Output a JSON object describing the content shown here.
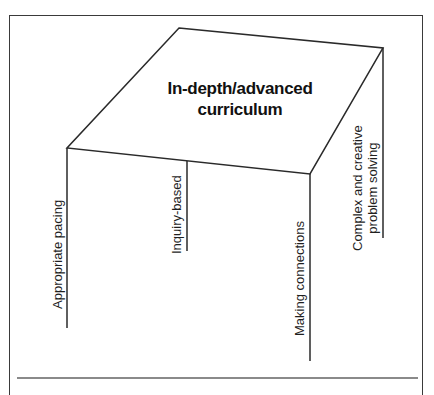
{
  "diagram": {
    "title_line1": "In-depth/advanced",
    "title_line2": "curriculum",
    "legs": [
      {
        "id": "front-left",
        "label": "Appropriate pacing"
      },
      {
        "id": "back-left",
        "label": "Inquiry-based"
      },
      {
        "id": "front-right",
        "label": "Making connections"
      },
      {
        "id": "back-right",
        "label_line1": "Complex and creative",
        "label_line2": "problem solving"
      }
    ],
    "colors": {
      "line": "#2a2a2a",
      "frame": "#3a3a3a",
      "rule": "#8a8a8a",
      "background": "#ffffff"
    }
  }
}
